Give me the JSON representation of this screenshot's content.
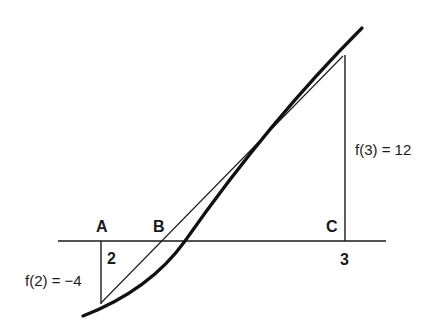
{
  "diagram": {
    "type": "linear-interpolation (false position) illustration",
    "points": {
      "A": "A",
      "B": "B",
      "C": "C"
    },
    "axis_ticks": {
      "left": "2",
      "right": "3"
    },
    "annotations": {
      "f_left": "f(2) = −4",
      "f_right": "f(3) = 12"
    },
    "colors": {
      "ink": "#1a1a1a",
      "background": "#ffffff"
    }
  }
}
